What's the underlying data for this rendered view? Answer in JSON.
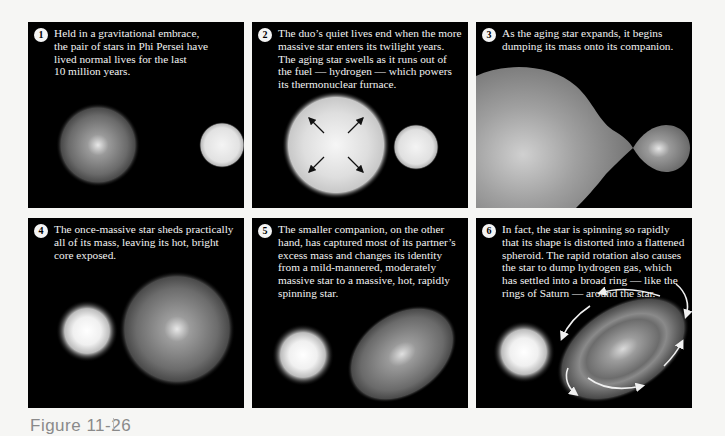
{
  "figure": {
    "label": "Figure 11-26"
  },
  "panels": [
    {
      "number": "1",
      "text": "Held in a gravitational embrace,\nthe pair of stars in Phi Persei have\nlived normal lives for the last\n10 million years."
    },
    {
      "number": "2",
      "text": "The duo’s quiet lives end when the more\nmassive star enters its twilight years.\nThe aging star swells as it runs out of\nthe fuel — hydrogen — which powers\nits thermonuclear furnace."
    },
    {
      "number": "3",
      "text": "As the aging star expands, it begins\ndumping its mass onto its companion."
    },
    {
      "number": "4",
      "text": "The once-massive star sheds practically\nall of its mass, leaving its hot, bright\ncore exposed."
    },
    {
      "number": "5",
      "text": "The smaller companion, on the other\nhand, has captured most of its partner’s\nexcess mass and changes its identity\nfrom a mild-mannered, moderately\nmassive star to a massive, hot, rapidly\nspinning star."
    },
    {
      "number": "6",
      "text": "In fact, the star is spinning so rapidly\nthat its shape is distorted into a flattened\nspheroid. The rapid rotation also causes\nthe star to dump hydrogen gas,  which\nhas settled into a broad ring — like the\nrings of Saturn — around the star."
    }
  ],
  "colors": {
    "panel_background": "#000000",
    "page_background": "#f6f6f4",
    "caption_text": "#f2f2f2",
    "figure_label": "#8a8a8a"
  }
}
